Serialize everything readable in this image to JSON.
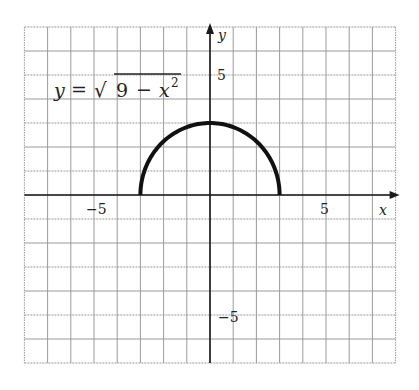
{
  "chart_data": {
    "type": "line",
    "title": "",
    "equation_label": {
      "lhs": "y",
      "eq": "=",
      "sqrt": "√",
      "inside_num": "9",
      "minus": "−",
      "var": "x",
      "exp": "2"
    },
    "xlabel": "x",
    "ylabel": "y",
    "xlim": [
      -8,
      8
    ],
    "ylim": [
      -7,
      7
    ],
    "grid": true,
    "x_ticks_labeled": [
      {
        "value": -5,
        "label": "−5"
      },
      {
        "value": 5,
        "label": "5"
      }
    ],
    "y_ticks_labeled": [
      {
        "value": 5,
        "label": "5"
      },
      {
        "value": -5,
        "label": "−5"
      }
    ],
    "series": [
      {
        "name": "y = sqrt(9 - x^2)",
        "x": [
          -3,
          -2.5,
          -2,
          -1.5,
          -1,
          -0.5,
          0,
          0.5,
          1,
          1.5,
          2,
          2.5,
          3
        ],
        "y": [
          0,
          1.66,
          2.24,
          2.6,
          2.83,
          2.96,
          3,
          2.96,
          2.83,
          2.6,
          2.24,
          1.66,
          0
        ],
        "color": "#111111"
      }
    ]
  },
  "colors": {
    "grid": "#9a9a9a",
    "axis": "#1a1a1a",
    "curve": "#111111"
  }
}
